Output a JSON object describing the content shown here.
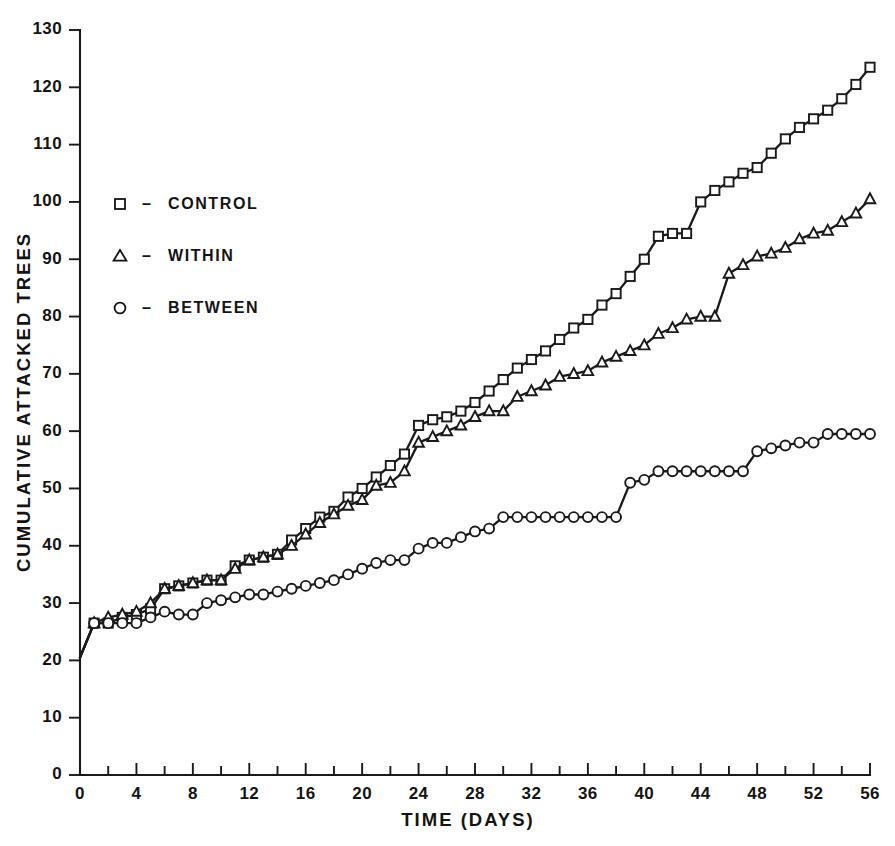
{
  "chart_data": {
    "type": "line",
    "title": "",
    "xlabel": "TIME (DAYS)",
    "ylabel": "CUMULATIVE ATTACKED TREES",
    "xlim": [
      0,
      56
    ],
    "ylim": [
      0,
      130
    ],
    "xticks": [
      0,
      4,
      8,
      12,
      16,
      20,
      24,
      28,
      32,
      36,
      40,
      44,
      48,
      52,
      56
    ],
    "xtick_labels": [
      "0",
      "4",
      "8",
      "12",
      "16",
      "20",
      "24",
      "28",
      "32",
      "36",
      "40",
      "44",
      "48",
      "52",
      "56"
    ],
    "xminor_step": 2,
    "yticks": [
      0,
      10,
      20,
      30,
      40,
      50,
      60,
      70,
      80,
      90,
      100,
      110,
      120,
      130
    ],
    "ytick_labels": [
      "0",
      "10",
      "20",
      "30",
      "40",
      "50",
      "60",
      "70",
      "80",
      "90",
      "100",
      "110",
      "120",
      "130"
    ],
    "grid": false,
    "legend_position": "upper-left-inside",
    "series": [
      {
        "name": "CONTROL",
        "marker": "square",
        "x": [
          0,
          1,
          2,
          3,
          4,
          5,
          6,
          7,
          8,
          9,
          10,
          11,
          12,
          13,
          14,
          15,
          16,
          17,
          18,
          19,
          20,
          21,
          22,
          23,
          24,
          25,
          26,
          27,
          28,
          29,
          30,
          31,
          32,
          33,
          34,
          35,
          36,
          37,
          38,
          39,
          40,
          41,
          42,
          43,
          44,
          45,
          46,
          47,
          48,
          49,
          50,
          51,
          52,
          53,
          54,
          55,
          56
        ],
        "values": [
          20.5,
          26.5,
          26.5,
          27.5,
          28,
          29,
          32.5,
          33,
          33.5,
          34,
          34,
          36.5,
          37.5,
          38,
          38.5,
          41,
          43,
          45,
          46,
          48.5,
          50,
          52,
          54,
          56,
          61,
          62,
          62.5,
          63.5,
          65,
          67,
          69,
          71,
          72.5,
          74,
          76,
          78,
          79.5,
          82,
          84,
          87,
          90,
          94,
          94.5,
          94.5,
          100,
          102,
          103.5,
          105,
          106,
          108.5,
          111,
          113,
          114.5,
          116,
          118,
          120.5,
          123.5
        ]
      },
      {
        "name": "WITHIN",
        "marker": "triangle",
        "x": [
          0,
          1,
          2,
          3,
          4,
          5,
          6,
          7,
          8,
          9,
          10,
          11,
          12,
          13,
          14,
          15,
          16,
          17,
          18,
          19,
          20,
          21,
          22,
          23,
          24,
          25,
          26,
          27,
          28,
          29,
          30,
          31,
          32,
          33,
          34,
          35,
          36,
          37,
          38,
          39,
          40,
          41,
          42,
          43,
          44,
          45,
          46,
          47,
          48,
          49,
          50,
          51,
          52,
          53,
          54,
          55,
          56
        ],
        "values": [
          20.5,
          26.5,
          27.5,
          28,
          28.5,
          30,
          32.5,
          33,
          33.5,
          34,
          34,
          36,
          37.5,
          38,
          38.5,
          40,
          42,
          44,
          45.5,
          47,
          48,
          50.5,
          51,
          53,
          58,
          59,
          60,
          61,
          62.5,
          63.5,
          63.5,
          66,
          67,
          68,
          69.5,
          70,
          70.5,
          72,
          73,
          74,
          75,
          77,
          78,
          79.5,
          80,
          80,
          87.5,
          89,
          90.5,
          91,
          92,
          93.5,
          94.5,
          95,
          96.5,
          98,
          100.5
        ]
      },
      {
        "name": "BETWEEN",
        "marker": "circle",
        "x": [
          0,
          1,
          2,
          3,
          4,
          5,
          6,
          7,
          8,
          9,
          10,
          11,
          12,
          13,
          14,
          15,
          16,
          17,
          18,
          19,
          20,
          21,
          22,
          23,
          24,
          25,
          26,
          27,
          28,
          29,
          30,
          31,
          32,
          33,
          34,
          35,
          36,
          37,
          38,
          39,
          40,
          41,
          42,
          43,
          44,
          45,
          46,
          47,
          48,
          49,
          50,
          51,
          52,
          53,
          54,
          55,
          56
        ],
        "values": [
          20.5,
          26.5,
          26.5,
          26.5,
          26.5,
          27.5,
          28.5,
          28,
          28,
          30,
          30.5,
          31,
          31.5,
          31.5,
          32,
          32.5,
          33,
          33.5,
          34,
          35,
          36,
          37,
          37.5,
          37.5,
          39.5,
          40.5,
          40.5,
          41.5,
          42.5,
          43,
          45,
          45,
          45,
          45,
          45,
          45,
          45,
          45,
          45,
          51,
          51.5,
          53,
          53,
          53,
          53,
          53,
          53,
          53,
          56.5,
          57,
          57.5,
          58,
          58,
          59.5,
          59.5,
          59.5,
          59.5
        ]
      }
    ]
  },
  "legend": {
    "entries": [
      {
        "marker": "square-marker",
        "dash": "–",
        "label": "CONTROL"
      },
      {
        "marker": "triangle-marker",
        "dash": "–",
        "label": "WITHIN"
      },
      {
        "marker": "circle-marker",
        "dash": "–",
        "label": "BETWEEN"
      }
    ]
  },
  "colors": {
    "ink": "#1a1a1a",
    "paper": "#ffffff",
    "marker_fill": "#ffffff"
  }
}
